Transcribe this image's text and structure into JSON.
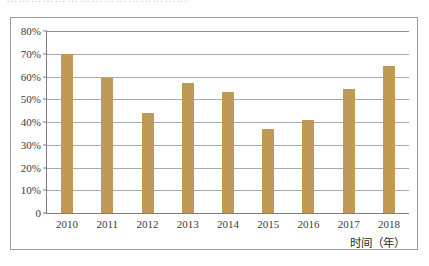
{
  "clipped_caption": "………………………………………",
  "chart_data": {
    "type": "bar",
    "title": "",
    "xlabel": "时间（年）",
    "ylabel": "",
    "categories": [
      "2010",
      "2011",
      "2012",
      "2013",
      "2014",
      "2015",
      "2016",
      "2017",
      "2018"
    ],
    "values": [
      70,
      59.5,
      44,
      57,
      53,
      37,
      41,
      54.5,
      64.5
    ],
    "ylim": [
      0,
      80
    ],
    "yticks": [
      0,
      10,
      20,
      30,
      40,
      50,
      60,
      70,
      80
    ],
    "ytick_labels": [
      "0",
      "10%",
      "20%",
      "30%",
      "40%",
      "50%",
      "60%",
      "70%",
      "80%"
    ],
    "grid": true,
    "legend": "none",
    "bar_color": "#c09a55",
    "series": [
      {
        "name": "",
        "values": [
          70,
          59.5,
          44,
          57,
          53,
          37,
          41,
          54.5,
          64.5
        ]
      }
    ]
  },
  "colors": {
    "bar": "#c09a55",
    "gridline": "#a9a9a9",
    "axis": "#7d7d7d",
    "frame": "#9a9a9a",
    "background": "#ffffff",
    "text": "#3a3a3a"
  }
}
